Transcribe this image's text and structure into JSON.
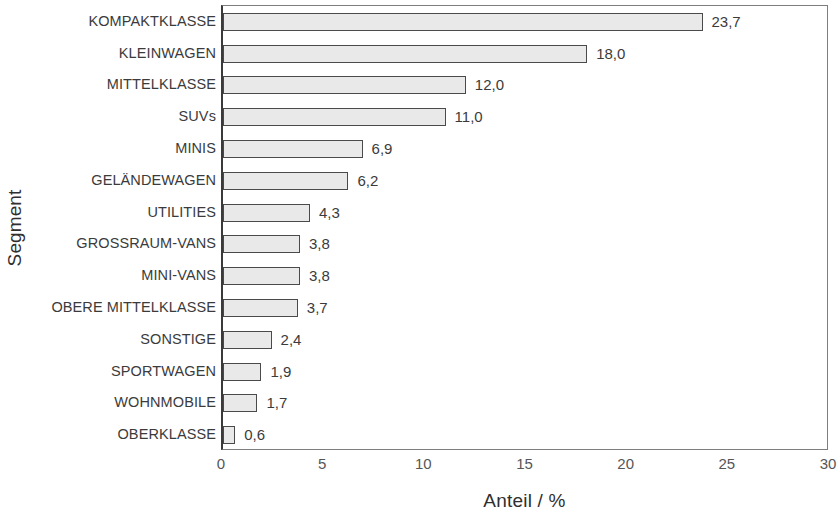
{
  "chart_data": {
    "type": "bar",
    "orientation": "horizontal",
    "title": "",
    "xlabel": "Anteil / %",
    "ylabel": "Segment",
    "xlim": [
      0,
      30
    ],
    "xticks": [
      "0",
      "5",
      "10",
      "15",
      "20",
      "25",
      "30"
    ],
    "xtick_values": [
      0,
      5,
      10,
      15,
      20,
      25,
      30
    ],
    "grid": false,
    "legend": null,
    "decimal_separator": ",",
    "categories": [
      "KOMPAKTKLASSE",
      "KLEINWAGEN",
      "MITTELKLASSE",
      "SUVs",
      "MINIS",
      "GELÄNDEWAGEN",
      "UTILITIES",
      "GROSSRAUM-VANS",
      "MINI-VANS",
      "OBERE MITTELKLASSE",
      "SONSTIGE",
      "SPORTWAGEN",
      "WOHNMOBILE",
      "OBERKLASSE"
    ],
    "values": [
      23.7,
      18.0,
      12.0,
      11.0,
      6.9,
      6.2,
      4.3,
      3.8,
      3.8,
      3.7,
      2.4,
      1.9,
      1.7,
      0.6
    ],
    "value_labels": [
      "23,7",
      "18,0",
      "12,0",
      "11,0",
      "6,9",
      "6,2",
      "4,3",
      "3,8",
      "3,8",
      "3,7",
      "2,4",
      "1,9",
      "1,7",
      "0,6"
    ],
    "bar_fill_color": "#e9e9e9",
    "bar_edge_color": "#4a4a4a",
    "axis_color": "#3a3a3a",
    "text_color": "#3b3b3b",
    "background_color": "#ffffff"
  }
}
